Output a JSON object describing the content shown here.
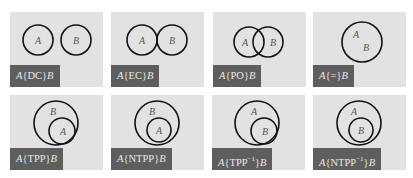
{
  "figure": {
    "panels": [
      {
        "id": "dc",
        "relation": "DC",
        "label_prefix": "A",
        "label_rel": "{DC}",
        "label_suffix": "B",
        "sup": ""
      },
      {
        "id": "ec",
        "relation": "EC",
        "label_prefix": "A",
        "label_rel": "{EC}",
        "label_suffix": "B",
        "sup": ""
      },
      {
        "id": "po",
        "relation": "PO",
        "label_prefix": "A",
        "label_rel": "{PO}",
        "label_suffix": "B",
        "sup": ""
      },
      {
        "id": "eq",
        "relation": "=",
        "label_prefix": "A",
        "label_rel": "{=}",
        "label_suffix": "B",
        "sup": ""
      },
      {
        "id": "tpp",
        "relation": "TPP",
        "label_prefix": "A",
        "label_rel": "{TPP}",
        "label_suffix": "B",
        "sup": ""
      },
      {
        "id": "ntpp",
        "relation": "NTPP",
        "label_prefix": "A",
        "label_rel": "{NTPP}",
        "label_suffix": "B",
        "sup": ""
      },
      {
        "id": "tppi",
        "relation": "TPP^-1",
        "label_prefix": "A",
        "label_rel_pre": "{TPP",
        "label_rel_post": "}",
        "label_suffix": "B",
        "sup": "−1"
      },
      {
        "id": "ntppi",
        "relation": "NTPP^-1",
        "label_prefix": "A",
        "label_rel_pre": "{NTPP",
        "label_rel_post": "}",
        "label_suffix": "B",
        "sup": "−1"
      }
    ],
    "region_labels": {
      "a": "A",
      "b": "B"
    },
    "colors": {
      "panel_bg": "#e2e2e2",
      "label_bg": "#5e5e5e",
      "label_text": "#e8e8e8",
      "stroke": "#111111"
    }
  }
}
